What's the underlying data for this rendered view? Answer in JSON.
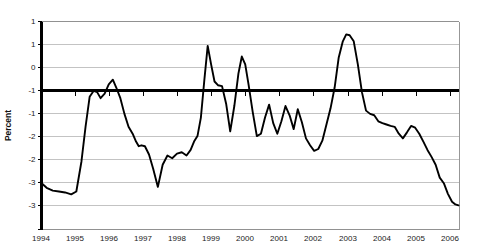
{
  "chart_data": {
    "type": "line",
    "title": "",
    "xlabel": "",
    "ylabel": "Percent",
    "ylim": [
      -3.0,
      1.5
    ],
    "xlim": [
      1994.0,
      2006.25
    ],
    "grid": true,
    "legend": false,
    "y_ticks": [
      1.5,
      1.0,
      0.5,
      0.0,
      -0.5,
      -1.0,
      -1.5,
      -2.0,
      -2.5,
      -3.0
    ],
    "y_tick_labels": [
      "1",
      "1",
      "0",
      "-1",
      "-1",
      "-2",
      "-2",
      "-3",
      "-3",
      ""
    ],
    "x_ticks": [
      1994,
      1995,
      1996,
      1997,
      1998,
      1999,
      2000,
      2001,
      2002,
      2003,
      2004,
      2005,
      2006
    ],
    "x_tick_labels": [
      "1994",
      "1995",
      "1996",
      "1997",
      "1998",
      "1999",
      "2000",
      "2001",
      "2002",
      "2003",
      "2004",
      "2005",
      "2006"
    ],
    "series": [
      {
        "name": "Percent",
        "color": "#000000",
        "x": [
          1994.0,
          1994.18,
          1994.36,
          1994.54,
          1994.72,
          1994.9,
          1995.05,
          1995.2,
          1995.32,
          1995.44,
          1995.56,
          1995.66,
          1995.76,
          1995.88,
          1996.0,
          1996.12,
          1996.22,
          1996.34,
          1996.46,
          1996.58,
          1996.7,
          1996.8,
          1996.88,
          1996.96,
          1997.06,
          1997.18,
          1997.3,
          1997.44,
          1997.58,
          1997.72,
          1997.86,
          1998.0,
          1998.14,
          1998.28,
          1998.4,
          1998.5,
          1998.6,
          1998.7,
          1998.8,
          1998.9,
          1999.0,
          1999.1,
          1999.2,
          1999.32,
          1999.44,
          1999.56,
          1999.68,
          1999.8,
          1999.9,
          2000.0,
          2000.1,
          2000.22,
          2000.34,
          2000.46,
          2000.58,
          2000.7,
          2000.82,
          2000.94,
          2001.06,
          2001.18,
          2001.3,
          2001.42,
          2001.54,
          2001.66,
          2001.78,
          2001.9,
          2002.02,
          2002.14,
          2002.26,
          2002.38,
          2002.5,
          2002.62,
          2002.74,
          2002.86,
          2002.96,
          2003.06,
          2003.18,
          2003.3,
          2003.42,
          2003.54,
          2003.66,
          2003.78,
          2003.9,
          2004.02,
          2004.14,
          2004.26,
          2004.38,
          2004.5,
          2004.62,
          2004.74,
          2004.86,
          2004.98,
          2005.1,
          2005.22,
          2005.34,
          2005.46,
          2005.58,
          2005.7,
          2005.82,
          2005.94,
          2006.06,
          2006.16,
          2006.25
        ],
        "y": [
          -2.0,
          -2.12,
          -2.18,
          -2.2,
          -2.22,
          -2.26,
          -2.2,
          -1.55,
          -0.8,
          -0.15,
          -0.02,
          -0.05,
          -0.18,
          -0.08,
          0.12,
          0.22,
          0.05,
          -0.18,
          -0.52,
          -0.8,
          -0.95,
          -1.12,
          -1.22,
          -1.2,
          -1.22,
          -1.4,
          -1.7,
          -2.1,
          -1.62,
          -1.42,
          -1.48,
          -1.38,
          -1.35,
          -1.42,
          -1.3,
          -1.12,
          -1.0,
          -0.6,
          0.2,
          0.95,
          0.55,
          0.18,
          0.1,
          0.08,
          -0.3,
          -0.9,
          -0.35,
          0.35,
          0.72,
          0.55,
          0.1,
          -0.48,
          -1.0,
          -0.95,
          -0.6,
          -0.32,
          -0.72,
          -0.95,
          -0.68,
          -0.35,
          -0.55,
          -0.85,
          -0.42,
          -0.7,
          -1.05,
          -1.2,
          -1.32,
          -1.28,
          -1.1,
          -0.75,
          -0.4,
          0.05,
          0.7,
          1.05,
          1.2,
          1.18,
          1.05,
          0.55,
          -0.05,
          -0.45,
          -0.52,
          -0.55,
          -0.68,
          -0.72,
          -0.75,
          -0.78,
          -0.8,
          -0.95,
          -1.05,
          -0.92,
          -0.78,
          -0.82,
          -0.95,
          -1.12,
          -1.3,
          -1.45,
          -1.62,
          -1.9,
          -2.02,
          -2.25,
          -2.42,
          -2.48,
          -2.5
        ]
      }
    ]
  }
}
